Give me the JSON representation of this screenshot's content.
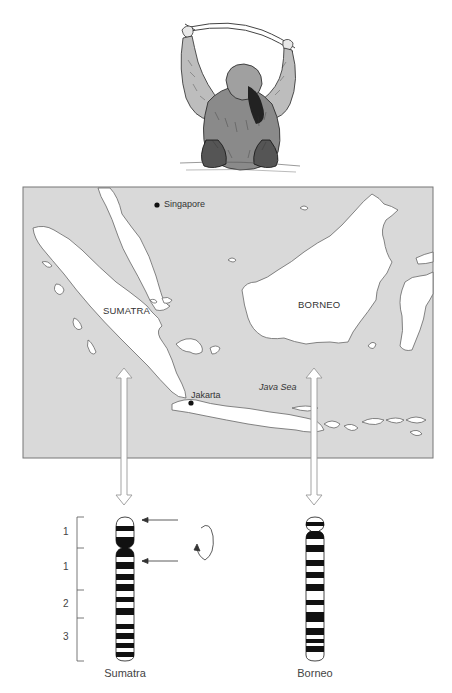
{
  "figure": {
    "illustration": {
      "subject": "orangutan hanging from branch"
    },
    "map": {
      "background_color": "#d9d9d9",
      "land_color": "#ffffff",
      "border_color": "#777777",
      "labels": {
        "singapore": "Singapore",
        "sumatra": "SUMATRA",
        "borneo": "BORNEO",
        "jakarta": "Jakarta",
        "java_sea": "Java Sea"
      },
      "cities": [
        {
          "name": "Singapore",
          "x": 157,
          "y": 205
        },
        {
          "name": "Jakarta",
          "x": 191,
          "y": 403
        }
      ]
    },
    "chromosomes": {
      "band_bracket_labels": [
        "1",
        "1",
        "2",
        "3"
      ],
      "sumatra": {
        "label": "Sumatra",
        "centromere_y": 548,
        "bands": [
          [
            526,
            531
          ],
          [
            537,
            546
          ],
          [
            549,
            557
          ],
          [
            562,
            569
          ],
          [
            574,
            580
          ],
          [
            584,
            591
          ],
          [
            597,
            602
          ],
          [
            608,
            615
          ],
          [
            624,
            629
          ],
          [
            633,
            639
          ],
          [
            643,
            648
          ],
          [
            652,
            657
          ]
        ]
      },
      "borneo": {
        "label": "Borneo",
        "centromere_y": 530,
        "bands": [
          [
            522,
            526
          ],
          [
            531,
            539
          ],
          [
            545,
            552
          ],
          [
            560,
            566
          ],
          [
            572,
            578
          ],
          [
            584,
            591
          ],
          [
            600,
            605
          ],
          [
            612,
            622
          ],
          [
            628,
            635
          ],
          [
            639,
            643
          ],
          [
            646,
            652
          ]
        ]
      },
      "annotations": {
        "arrows_count": 2,
        "inversion_symbol": "circular-arrow"
      }
    }
  }
}
